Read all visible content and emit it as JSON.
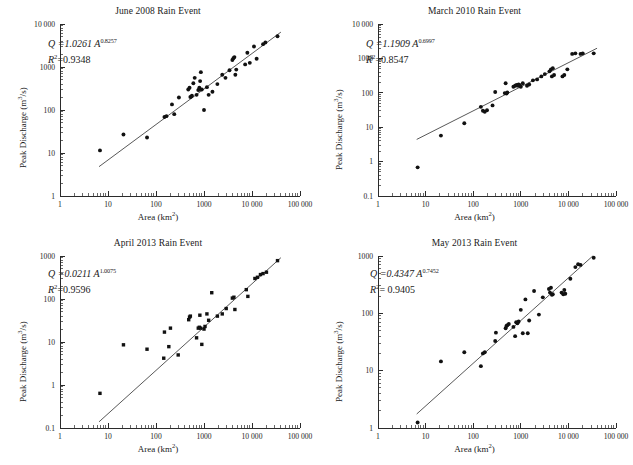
{
  "figure": {
    "panel_count": 4,
    "axis_label_x": "Area (km",
    "axis_label_x_sup": "2",
    "axis_label_x_tail": ")",
    "axis_label_y": "Peak Discharge (m",
    "axis_label_y_sup": "3",
    "axis_label_y_tail": "/s)"
  },
  "chart_data": [
    {
      "id": "june-2008",
      "type": "scatter",
      "title": "June 2008 Rain Event",
      "xlabel": "Area (km2)",
      "ylabel": "Peak Discharge (m3/s)",
      "xscale": "log",
      "yscale": "log",
      "xlim": [
        1,
        100000
      ],
      "ylim": [
        1,
        10000
      ],
      "xticks": [
        1,
        10,
        100,
        1000,
        10000,
        100000
      ],
      "xticklabels": [
        "1",
        "10",
        "100",
        "1000",
        "10 000",
        "100 000"
      ],
      "yticks": [
        1,
        10,
        100,
        1000,
        10000
      ],
      "yticklabels": [
        "1",
        "10",
        "100",
        "1000",
        "10 000"
      ],
      "grid": false,
      "legend": false,
      "marker": "circle",
      "annotation_equation": "Q =1.0261 A",
      "annotation_exponent": "0.8257",
      "annotation_r2_label": "R",
      "annotation_r2_sup": "2",
      "annotation_r2_value": "=0.9348",
      "fit": {
        "coefficient": 1.0261,
        "exponent": 0.8257,
        "r2": 0.9348,
        "x_start": 6.5,
        "x_end": 40000
      },
      "points": [
        [
          6.8,
          11.5
        ],
        [
          21,
          27
        ],
        [
          65,
          23
        ],
        [
          150,
          69
        ],
        [
          165,
          72
        ],
        [
          215,
          135
        ],
        [
          240,
          80
        ],
        [
          300,
          195
        ],
        [
          470,
          300
        ],
        [
          500,
          330
        ],
        [
          520,
          200
        ],
        [
          545,
          205
        ],
        [
          560,
          215
        ],
        [
          600,
          420
        ],
        [
          640,
          560
        ],
        [
          700,
          225
        ],
        [
          760,
          290
        ],
        [
          790,
          300
        ],
        [
          800,
          330
        ],
        [
          830,
          470
        ],
        [
          860,
          760
        ],
        [
          900,
          300
        ],
        [
          1000,
          100
        ],
        [
          1150,
          340
        ],
        [
          1250,
          225
        ],
        [
          1500,
          265
        ],
        [
          1900,
          400
        ],
        [
          2400,
          660
        ],
        [
          2800,
          560
        ],
        [
          3400,
          840
        ],
        [
          3900,
          1450
        ],
        [
          4100,
          1600
        ],
        [
          4300,
          1700
        ],
        [
          4500,
          660
        ],
        [
          4700,
          870
        ],
        [
          7200,
          1150
        ],
        [
          8000,
          2150
        ],
        [
          9000,
          1250
        ],
        [
          11000,
          3000
        ],
        [
          12500,
          1550
        ],
        [
          17000,
          3400
        ],
        [
          19000,
          3700
        ],
        [
          34000,
          5200
        ]
      ]
    },
    {
      "id": "march-2010",
      "type": "scatter",
      "title": "March 2010 Rain Event",
      "xlabel": "Area (km2)",
      "ylabel": "Peak Discharge (m3/s)",
      "xscale": "log",
      "yscale": "log",
      "xlim": [
        1,
        100000
      ],
      "ylim": [
        0.1,
        10000
      ],
      "xticks": [
        1,
        10,
        100,
        1000,
        10000,
        100000
      ],
      "xticklabels": [
        "1",
        "10",
        "100",
        "1000",
        "10 000",
        "100 000"
      ],
      "yticks": [
        0.1,
        1,
        10,
        100,
        1000,
        10000
      ],
      "yticklabels": [
        "0.1",
        "1",
        "10",
        "100",
        "1000",
        "10 000"
      ],
      "grid": false,
      "legend": false,
      "marker": "circle",
      "annotation_equation": "Q =1.1909 A",
      "annotation_exponent": "0.6997",
      "annotation_r2_label": "R",
      "annotation_r2_sup": "2",
      "annotation_r2_value": "=0.8547",
      "fit": {
        "coefficient": 1.1909,
        "exponent": 0.6997,
        "r2": 0.8547,
        "x_start": 6.5,
        "x_end": 40000
      },
      "points": [
        [
          6.8,
          0.68
        ],
        [
          21,
          5.7
        ],
        [
          65,
          13
        ],
        [
          145,
          39
        ],
        [
          160,
          30
        ],
        [
          175,
          28
        ],
        [
          195,
          31
        ],
        [
          255,
          43
        ],
        [
          290,
          105
        ],
        [
          460,
          98
        ],
        [
          480,
          190
        ],
        [
          500,
          95
        ],
        [
          520,
          102
        ],
        [
          700,
          150
        ],
        [
          760,
          160
        ],
        [
          800,
          165
        ],
        [
          840,
          170
        ],
        [
          880,
          160
        ],
        [
          900,
          175
        ],
        [
          950,
          165
        ],
        [
          1000,
          150
        ],
        [
          1100,
          190
        ],
        [
          1350,
          160
        ],
        [
          1500,
          175
        ],
        [
          1800,
          230
        ],
        [
          2200,
          245
        ],
        [
          2700,
          300
        ],
        [
          3200,
          350
        ],
        [
          4000,
          420
        ],
        [
          4300,
          480
        ],
        [
          4500,
          300
        ],
        [
          4700,
          520
        ],
        [
          5000,
          330
        ],
        [
          7500,
          300
        ],
        [
          8200,
          330
        ],
        [
          9500,
          480
        ],
        [
          12000,
          1350
        ],
        [
          14000,
          1400
        ],
        [
          18000,
          1350
        ],
        [
          20000,
          1400
        ],
        [
          34000,
          1400
        ]
      ]
    },
    {
      "id": "april-2013",
      "type": "scatter",
      "title": "April 2013 Rain Event",
      "xlabel": "Area (km2)",
      "ylabel": "Peak Discharge (m3/s)",
      "xscale": "log",
      "yscale": "log",
      "xlim": [
        1,
        100000
      ],
      "ylim": [
        0.1,
        1000
      ],
      "xticks": [
        1,
        10,
        100,
        1000,
        10000,
        100000
      ],
      "xticklabels": [
        "1",
        "10",
        "100",
        "1000",
        "10 000",
        "100 000"
      ],
      "yticks": [
        0.1,
        1,
        10,
        100,
        1000
      ],
      "yticklabels": [
        "0.1",
        "1",
        "10",
        "100",
        "1000"
      ],
      "grid": false,
      "legend": false,
      "marker": "square",
      "annotation_equation": "Q =0.0211 A",
      "annotation_exponent": "1.0075",
      "annotation_r2_label": "R",
      "annotation_r2_sup": "2",
      "annotation_r2_value": "=0.9596",
      "fit": {
        "coefficient": 0.0211,
        "exponent": 1.0075,
        "r2": 0.9596,
        "x_start": 6.5,
        "x_end": 40000
      },
      "points": [
        [
          6.8,
          0.64
        ],
        [
          21,
          8.6
        ],
        [
          65,
          6.8
        ],
        [
          145,
          4.2
        ],
        [
          150,
          17
        ],
        [
          185,
          7.8
        ],
        [
          200,
          21
        ],
        [
          290,
          5.0
        ],
        [
          480,
          33
        ],
        [
          500,
          38
        ],
        [
          520,
          40
        ],
        [
          700,
          12.5
        ],
        [
          760,
          21
        ],
        [
          800,
          22
        ],
        [
          820,
          42
        ],
        [
          850,
          21
        ],
        [
          900,
          8.8
        ],
        [
          1000,
          20
        ],
        [
          1050,
          23
        ],
        [
          1150,
          45
        ],
        [
          1250,
          32
        ],
        [
          1450,
          140
        ],
        [
          1900,
          40
        ],
        [
          2400,
          45
        ],
        [
          2900,
          60
        ],
        [
          3900,
          105
        ],
        [
          4200,
          110
        ],
        [
          4400,
          57
        ],
        [
          7600,
          165
        ],
        [
          8200,
          115
        ],
        [
          11500,
          300
        ],
        [
          13000,
          320
        ],
        [
          15000,
          370
        ],
        [
          17000,
          390
        ],
        [
          20000,
          420
        ],
        [
          34000,
          780
        ]
      ]
    },
    {
      "id": "may-2013",
      "type": "scatter",
      "title": "May 2013 Rain Event",
      "xlabel": "Area (km2)",
      "ylabel": "Peak Discharge (m3/s)",
      "xscale": "log",
      "yscale": "log",
      "xlim": [
        1,
        100000
      ],
      "ylim": [
        1,
        1000
      ],
      "xticks": [
        1,
        10,
        100,
        1000,
        10000,
        100000
      ],
      "xticklabels": [
        "1",
        "10",
        "100",
        "1000",
        "10 000",
        "100 000"
      ],
      "yticks": [
        1,
        10,
        100,
        1000
      ],
      "yticklabels": [
        "1",
        "10",
        "100",
        "1000"
      ],
      "grid": false,
      "legend": false,
      "marker": "circle",
      "annotation_equation": "Q =0.4347 A",
      "annotation_exponent": "0.7452",
      "annotation_r2_label": "R",
      "annotation_r2_sup": "2",
      "annotation_r2_value": "= 0.9405",
      "fit": {
        "coefficient": 0.4347,
        "exponent": 0.7452,
        "r2": 0.9405,
        "x_start": 6.5,
        "x_end": 40000
      },
      "points": [
        [
          6.8,
          1.25
        ],
        [
          21,
          14.5
        ],
        [
          65,
          21
        ],
        [
          145,
          12
        ],
        [
          160,
          20
        ],
        [
          175,
          21
        ],
        [
          290,
          33
        ],
        [
          300,
          46
        ],
        [
          480,
          55
        ],
        [
          500,
          60
        ],
        [
          520,
          62
        ],
        [
          560,
          65
        ],
        [
          700,
          58
        ],
        [
          760,
          40
        ],
        [
          800,
          70
        ],
        [
          850,
          67
        ],
        [
          900,
          72
        ],
        [
          1000,
          115
        ],
        [
          1100,
          45
        ],
        [
          1250,
          175
        ],
        [
          1400,
          45
        ],
        [
          1500,
          75
        ],
        [
          1900,
          245
        ],
        [
          2400,
          95
        ],
        [
          2900,
          190
        ],
        [
          3900,
          265
        ],
        [
          4100,
          230
        ],
        [
          4300,
          280
        ],
        [
          4500,
          210
        ],
        [
          4700,
          215
        ],
        [
          7200,
          230
        ],
        [
          7800,
          215
        ],
        [
          8200,
          255
        ],
        [
          8600,
          220
        ],
        [
          11000,
          400
        ],
        [
          14000,
          640
        ],
        [
          16000,
          720
        ],
        [
          18000,
          700
        ],
        [
          34000,
          930
        ]
      ]
    }
  ]
}
